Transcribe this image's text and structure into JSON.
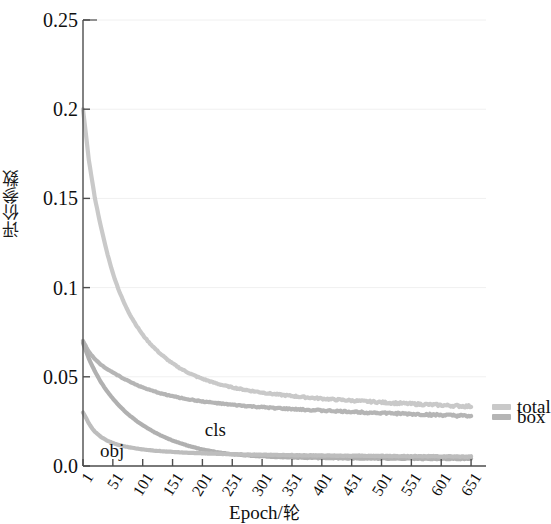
{
  "chart_data": {
    "type": "line",
    "title": "",
    "xlabel": "Epoch/轮",
    "ylabel": "评价参数",
    "xlim": [
      1,
      676
    ],
    "ylim": [
      0.0,
      0.25
    ],
    "grid": true,
    "grid_axis": "y",
    "legend_position": "right-outside",
    "xticks": [
      1,
      51,
      101,
      151,
      201,
      251,
      301,
      351,
      401,
      451,
      501,
      551,
      601,
      651
    ],
    "xtick_labels": [
      "1",
      "51",
      "101",
      "151",
      "201",
      "251",
      "301",
      "351",
      "401",
      "451",
      "501",
      "551",
      "601",
      "651"
    ],
    "yticks": [
      0.0,
      0.05,
      0.1,
      0.15,
      0.2,
      0.25
    ],
    "ytick_labels": [
      "0.0",
      "0.05",
      "0.1",
      "0.15",
      "0.2",
      "0.25"
    ],
    "annotations": [
      {
        "text": "obj",
        "x": 26,
        "y": 0.012
      },
      {
        "text": "cls",
        "x": 205,
        "y": 0.02
      }
    ],
    "series": [
      {
        "name": "total",
        "label": "total",
        "color": "#c9c9c9",
        "legend": "right",
        "x": [
          1,
          11,
          21,
          31,
          41,
          51,
          61,
          71,
          81,
          91,
          101,
          111,
          121,
          131,
          141,
          151,
          161,
          171,
          181,
          191,
          201,
          221,
          241,
          261,
          281,
          301,
          321,
          341,
          361,
          381,
          401,
          421,
          441,
          461,
          481,
          501,
          521,
          541,
          561,
          581,
          601,
          621,
          641,
          651
        ],
        "values": [
          0.2,
          0.171,
          0.15,
          0.134,
          0.12,
          0.108,
          0.0985,
          0.0905,
          0.084,
          0.0785,
          0.0735,
          0.0695,
          0.066,
          0.0628,
          0.06,
          0.0575,
          0.0553,
          0.0534,
          0.0517,
          0.0502,
          0.0489,
          0.0466,
          0.0448,
          0.0434,
          0.0422,
          0.0412,
          0.0403,
          0.0396,
          0.0389,
          0.0383,
          0.0378,
          0.0373,
          0.0369,
          0.0365,
          0.0361,
          0.0357,
          0.0353,
          0.035,
          0.0347,
          0.0344,
          0.0341,
          0.0338,
          0.0335,
          0.0334
        ]
      },
      {
        "name": "box",
        "label": "box",
        "color": "#b5b5b5",
        "legend": "right",
        "x": [
          1,
          11,
          21,
          31,
          41,
          51,
          61,
          71,
          81,
          91,
          101,
          121,
          141,
          161,
          181,
          201,
          241,
          281,
          321,
          361,
          401,
          441,
          481,
          521,
          561,
          601,
          641,
          651
        ],
        "values": [
          0.07,
          0.064,
          0.0598,
          0.0568,
          0.0545,
          0.0525,
          0.0505,
          0.0487,
          0.047,
          0.0455,
          0.044,
          0.0417,
          0.0399,
          0.0384,
          0.0372,
          0.0362,
          0.0346,
          0.0334,
          0.0325,
          0.0317,
          0.0311,
          0.0305,
          0.03,
          0.0295,
          0.029,
          0.0285,
          0.028,
          0.0278
        ]
      },
      {
        "name": "cls",
        "label": "cls",
        "color": "#b0b0b0",
        "legend": "inline",
        "x": [
          1,
          11,
          21,
          31,
          41,
          51,
          61,
          71,
          81,
          91,
          101,
          111,
          121,
          131,
          141,
          151,
          161,
          171,
          181,
          191,
          201,
          211,
          221,
          241,
          261,
          281,
          301,
          341,
          381,
          421,
          461,
          501,
          541,
          581,
          621,
          651
        ],
        "values": [
          0.069,
          0.06,
          0.053,
          0.047,
          0.042,
          0.0378,
          0.034,
          0.0307,
          0.0278,
          0.0252,
          0.0229,
          0.0208,
          0.0189,
          0.0172,
          0.0157,
          0.0143,
          0.0131,
          0.012,
          0.011,
          0.0101,
          0.0093,
          0.0086,
          0.008,
          0.007,
          0.0063,
          0.0058,
          0.0054,
          0.0049,
          0.0046,
          0.0044,
          0.0043,
          0.0042,
          0.0041,
          0.004,
          0.004,
          0.004
        ]
      },
      {
        "name": "obj",
        "label": "obj",
        "color": "#bdbdbd",
        "legend": "inline",
        "x": [
          1,
          6,
          11,
          16,
          21,
          31,
          41,
          51,
          61,
          71,
          81,
          101,
          121,
          141,
          161,
          181,
          201,
          241,
          281,
          321,
          361,
          401,
          441,
          481,
          521,
          561,
          601,
          641,
          651
        ],
        "values": [
          0.03,
          0.027,
          0.0238,
          0.0212,
          0.0192,
          0.0163,
          0.0143,
          0.0129,
          0.0118,
          0.011,
          0.0103,
          0.0093,
          0.0086,
          0.0081,
          0.0077,
          0.0074,
          0.0071,
          0.0067,
          0.0064,
          0.0062,
          0.006,
          0.0059,
          0.0058,
          0.0057,
          0.0056,
          0.0055,
          0.0054,
          0.0053,
          0.0053
        ]
      }
    ]
  },
  "axis": {
    "y_title": "评价参数",
    "x_title_latin": "Epoch/",
    "x_title_cjk": "轮"
  },
  "annotations": {
    "obj": "obj",
    "cls": "cls"
  },
  "legend": {
    "total": "total",
    "box": "box"
  },
  "yticks": {
    "t0": "0.0",
    "t1": "0.05",
    "t2": "0.1",
    "t3": "0.15",
    "t4": "0.2",
    "t5": "0.25"
  },
  "xticks": {
    "t0": "1",
    "t1": "51",
    "t2": "101",
    "t3": "151",
    "t4": "201",
    "t5": "251",
    "t6": "301",
    "t7": "351",
    "t8": "401",
    "t9": "451",
    "t10": "501",
    "t11": "551",
    "t12": "601",
    "t13": "651"
  },
  "colors": {
    "total": "#c9c9c9",
    "box": "#b5b5b5",
    "cls": "#b0b0b0",
    "obj": "#bdbdbd",
    "axis": "#4d4d4d",
    "grid": "#f0f0f0"
  }
}
